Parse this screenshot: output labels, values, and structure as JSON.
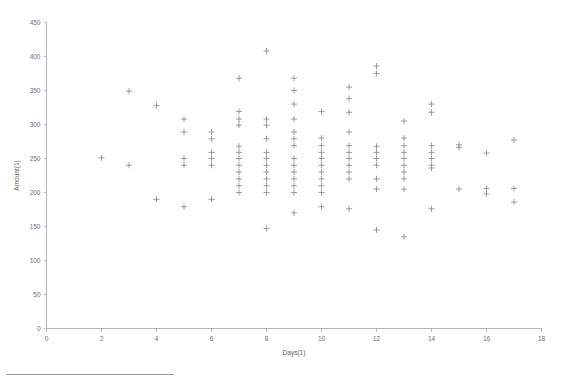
{
  "chart_data": {
    "type": "scatter",
    "title": "",
    "xlabel": "Days(1)",
    "ylabel": "Amount(1)",
    "xlim": [
      0,
      18
    ],
    "ylim": [
      0,
      450
    ],
    "xticks": [
      0,
      2,
      4,
      6,
      8,
      10,
      12,
      14,
      16,
      18
    ],
    "yticks": [
      0,
      50,
      100,
      150,
      200,
      250,
      300,
      350,
      400,
      450
    ],
    "xtick_labels": [
      "0",
      "2",
      "4",
      "6",
      "8",
      "10",
      "12",
      "14",
      "16",
      "18"
    ],
    "ytick_labels": [
      "0",
      "50",
      "100",
      "150",
      "200",
      "250",
      "300",
      "350",
      "400",
      "450"
    ],
    "grid": false,
    "legend": null,
    "marker": "plus",
    "marker_color": "#8f8f99",
    "axis_color": "#b4b4bc",
    "points": [
      {
        "x": 2,
        "y": 251
      },
      {
        "x": 3,
        "y": 349
      },
      {
        "x": 3,
        "y": 240
      },
      {
        "x": 4,
        "y": 328
      },
      {
        "x": 4,
        "y": 190
      },
      {
        "x": 5,
        "y": 308
      },
      {
        "x": 5,
        "y": 289
      },
      {
        "x": 5,
        "y": 250
      },
      {
        "x": 5,
        "y": 240
      },
      {
        "x": 5,
        "y": 179
      },
      {
        "x": 6,
        "y": 289
      },
      {
        "x": 6,
        "y": 279
      },
      {
        "x": 6,
        "y": 259
      },
      {
        "x": 6,
        "y": 250
      },
      {
        "x": 6,
        "y": 240
      },
      {
        "x": 6,
        "y": 190
      },
      {
        "x": 7,
        "y": 368
      },
      {
        "x": 7,
        "y": 319
      },
      {
        "x": 7,
        "y": 308
      },
      {
        "x": 7,
        "y": 299
      },
      {
        "x": 7,
        "y": 268
      },
      {
        "x": 7,
        "y": 259
      },
      {
        "x": 7,
        "y": 250
      },
      {
        "x": 7,
        "y": 240
      },
      {
        "x": 7,
        "y": 230
      },
      {
        "x": 7,
        "y": 220
      },
      {
        "x": 7,
        "y": 210
      },
      {
        "x": 7,
        "y": 200
      },
      {
        "x": 8,
        "y": 408
      },
      {
        "x": 8,
        "y": 308
      },
      {
        "x": 8,
        "y": 299
      },
      {
        "x": 8,
        "y": 279
      },
      {
        "x": 8,
        "y": 259
      },
      {
        "x": 8,
        "y": 250
      },
      {
        "x": 8,
        "y": 240
      },
      {
        "x": 8,
        "y": 230
      },
      {
        "x": 8,
        "y": 220
      },
      {
        "x": 8,
        "y": 210
      },
      {
        "x": 8,
        "y": 200
      },
      {
        "x": 8,
        "y": 147
      },
      {
        "x": 9,
        "y": 368
      },
      {
        "x": 9,
        "y": 350
      },
      {
        "x": 9,
        "y": 330
      },
      {
        "x": 9,
        "y": 308
      },
      {
        "x": 9,
        "y": 289
      },
      {
        "x": 9,
        "y": 279
      },
      {
        "x": 9,
        "y": 269
      },
      {
        "x": 9,
        "y": 250
      },
      {
        "x": 9,
        "y": 240
      },
      {
        "x": 9,
        "y": 230
      },
      {
        "x": 9,
        "y": 220
      },
      {
        "x": 9,
        "y": 210
      },
      {
        "x": 9,
        "y": 200
      },
      {
        "x": 9,
        "y": 170
      },
      {
        "x": 10,
        "y": 319
      },
      {
        "x": 10,
        "y": 280
      },
      {
        "x": 10,
        "y": 269
      },
      {
        "x": 10,
        "y": 259
      },
      {
        "x": 10,
        "y": 250
      },
      {
        "x": 10,
        "y": 240
      },
      {
        "x": 10,
        "y": 230
      },
      {
        "x": 10,
        "y": 220
      },
      {
        "x": 10,
        "y": 210
      },
      {
        "x": 10,
        "y": 200
      },
      {
        "x": 10,
        "y": 179
      },
      {
        "x": 11,
        "y": 355
      },
      {
        "x": 11,
        "y": 338
      },
      {
        "x": 11,
        "y": 318
      },
      {
        "x": 11,
        "y": 289
      },
      {
        "x": 11,
        "y": 269
      },
      {
        "x": 11,
        "y": 259
      },
      {
        "x": 11,
        "y": 250
      },
      {
        "x": 11,
        "y": 240
      },
      {
        "x": 11,
        "y": 230
      },
      {
        "x": 11,
        "y": 220
      },
      {
        "x": 11,
        "y": 176
      },
      {
        "x": 12,
        "y": 386
      },
      {
        "x": 12,
        "y": 375
      },
      {
        "x": 12,
        "y": 268
      },
      {
        "x": 12,
        "y": 259
      },
      {
        "x": 12,
        "y": 250
      },
      {
        "x": 12,
        "y": 240
      },
      {
        "x": 12,
        "y": 220
      },
      {
        "x": 12,
        "y": 205
      },
      {
        "x": 12,
        "y": 145
      },
      {
        "x": 13,
        "y": 305
      },
      {
        "x": 13,
        "y": 280
      },
      {
        "x": 13,
        "y": 269
      },
      {
        "x": 13,
        "y": 259
      },
      {
        "x": 13,
        "y": 250
      },
      {
        "x": 13,
        "y": 240
      },
      {
        "x": 13,
        "y": 230
      },
      {
        "x": 13,
        "y": 220
      },
      {
        "x": 13,
        "y": 205
      },
      {
        "x": 13,
        "y": 135
      },
      {
        "x": 14,
        "y": 330
      },
      {
        "x": 14,
        "y": 318
      },
      {
        "x": 14,
        "y": 269
      },
      {
        "x": 14,
        "y": 259
      },
      {
        "x": 14,
        "y": 250
      },
      {
        "x": 14,
        "y": 240
      },
      {
        "x": 14,
        "y": 236
      },
      {
        "x": 14,
        "y": 176
      },
      {
        "x": 15,
        "y": 270
      },
      {
        "x": 15,
        "y": 266
      },
      {
        "x": 15,
        "y": 205
      },
      {
        "x": 16,
        "y": 258
      },
      {
        "x": 16,
        "y": 206
      },
      {
        "x": 16,
        "y": 198
      },
      {
        "x": 17,
        "y": 277
      },
      {
        "x": 17,
        "y": 206
      },
      {
        "x": 17,
        "y": 186
      }
    ]
  }
}
